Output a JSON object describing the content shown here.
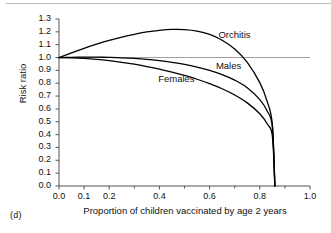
{
  "figure": {
    "panel_label": "(d)",
    "background_color": "#ffffff",
    "curve_color": "#000000",
    "reference_line_color": "#a0a0a0",
    "axis_color": "#555555"
  },
  "chart_data": {
    "type": "line",
    "title": "",
    "xlabel": "Proportion of children vaccinated by age 2 years",
    "ylabel": "Risk ratio",
    "xlim": [
      0.0,
      1.0
    ],
    "ylim": [
      0.0,
      1.3
    ],
    "grid": false,
    "legend_position": "inline-annotations",
    "x_tick_labels": [
      "0.0",
      "0.1",
      "0.2",
      "0.4",
      "0.6",
      "0.8",
      "1.0"
    ],
    "x_tick_values": [
      0.0,
      0.1,
      0.2,
      0.4,
      0.6,
      0.8,
      1.0
    ],
    "x_minor_tick_values": [
      0.3,
      0.5,
      0.7,
      0.9
    ],
    "y_tick_labels": [
      "0.0",
      "0.1",
      "0.2",
      "0.3",
      "0.4",
      "0.5",
      "0.6",
      "0.7",
      "0.8",
      "0.9",
      "1.0",
      "1.1",
      "1.2",
      "1.3"
    ],
    "y_tick_values": [
      0.0,
      0.1,
      0.2,
      0.3,
      0.4,
      0.5,
      0.6,
      0.7,
      0.8,
      0.9,
      1.0,
      1.1,
      1.2,
      1.3
    ],
    "reference_lines": [
      {
        "name": "null-effect",
        "axis": "y",
        "value": 1.0,
        "color": "#a0a0a0",
        "x_from": 0.0,
        "x_to": 1.0
      }
    ],
    "annotations": [
      {
        "text": "Orchitis",
        "x": 0.635,
        "y": 1.175
      },
      {
        "text": "Males",
        "x": 0.625,
        "y": 0.935
      },
      {
        "text": "Females",
        "x": 0.395,
        "y": 0.835
      }
    ],
    "x": [
      0.0,
      0.05,
      0.1,
      0.15,
      0.2,
      0.25,
      0.3,
      0.35,
      0.4,
      0.45,
      0.5,
      0.55,
      0.6,
      0.65,
      0.7,
      0.75,
      0.8,
      0.83,
      0.85,
      0.86
    ],
    "series": [
      {
        "name": "Orchitis",
        "label": "Orchitis",
        "values": [
          1.0,
          1.037,
          1.072,
          1.104,
          1.133,
          1.159,
          1.181,
          1.199,
          1.212,
          1.219,
          1.218,
          1.206,
          1.18,
          1.135,
          1.066,
          0.963,
          0.805,
          0.655,
          0.48,
          0.0
        ]
      },
      {
        "name": "Males",
        "label": "Males",
        "values": [
          1.0,
          1.002,
          1.003,
          1.003,
          1.001,
          0.998,
          0.993,
          0.986,
          0.976,
          0.963,
          0.947,
          0.926,
          0.9,
          0.867,
          0.824,
          0.765,
          0.673,
          0.582,
          0.46,
          0.0
        ]
      },
      {
        "name": "Females",
        "label": "Females",
        "values": [
          1.0,
          0.998,
          0.993,
          0.986,
          0.976,
          0.963,
          0.948,
          0.93,
          0.91,
          0.887,
          0.861,
          0.831,
          0.797,
          0.757,
          0.708,
          0.647,
          0.562,
          0.483,
          0.39,
          0.0
        ]
      }
    ]
  }
}
